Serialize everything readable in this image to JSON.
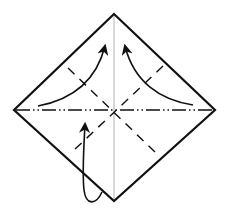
{
  "diagram": {
    "title": "Origami folding step",
    "colors": {
      "outline": "#111111",
      "center_crease": "#b0b0b0",
      "fold_line": "#111111",
      "arrow": "#111111",
      "background": "#ffffff"
    },
    "paper": {
      "shape": "diamond",
      "top": [
        114,
        14
      ],
      "right": [
        215,
        110
      ],
      "bottom": [
        114,
        201
      ],
      "left": [
        14,
        110
      ]
    },
    "lines": [
      {
        "id": "vertical-crease",
        "type": "existing-crease",
        "from": [
          114,
          14
        ],
        "to": [
          114,
          201
        ]
      },
      {
        "id": "horizontal-mountain-fold",
        "type": "mountain-fold",
        "from": [
          14,
          110
        ],
        "to": [
          215,
          110
        ]
      },
      {
        "id": "diagonal-valley-fold-1",
        "type": "valley-fold",
        "from": [
          68,
          68
        ],
        "to": [
          158,
          155
        ]
      },
      {
        "id": "diagonal-valley-fold-2",
        "type": "valley-fold",
        "from": [
          163,
          66
        ],
        "to": [
          72,
          152
        ]
      }
    ],
    "arrows": [
      {
        "id": "arrow-upper-left",
        "kind": "fold-up",
        "from": [
          38,
          106
        ],
        "to": [
          105,
          46
        ]
      },
      {
        "id": "arrow-upper-right",
        "kind": "fold-up",
        "from": [
          193,
          105
        ],
        "to": [
          125,
          46
        ]
      },
      {
        "id": "arrow-bottom-loop",
        "kind": "fold-behind",
        "from": [
          102,
          192
        ],
        "to": [
          85,
          123
        ]
      }
    ]
  }
}
